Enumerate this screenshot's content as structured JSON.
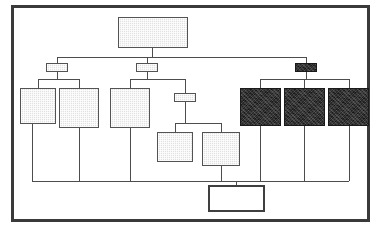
{
  "diagram": {
    "title": "",
    "frame": {
      "x": 11,
      "y": 5,
      "width": 359,
      "height": 217,
      "border_color": "#3a3a3a"
    },
    "palette": {
      "light_fill": "#e2e2e2",
      "dark_fill": "#262626",
      "empty_fill": "#ffffff",
      "line_color": "#4d4d4d",
      "border_color": "#4a4a4a",
      "background": "#ffffff"
    },
    "nodes": [
      {
        "id": "root",
        "label": "",
        "fill": "light",
        "x": 118,
        "y": 17,
        "width": 70,
        "height": 31,
        "level": 0
      },
      {
        "id": "conn-left",
        "label": "",
        "fill": "light",
        "x": 46,
        "y": 63,
        "width": 22,
        "height": 9,
        "level": 1
      },
      {
        "id": "conn-mid",
        "label": "",
        "fill": "light",
        "x": 136,
        "y": 63,
        "width": 22,
        "height": 9,
        "level": 1
      },
      {
        "id": "conn-right",
        "label": "",
        "fill": "dark",
        "x": 295,
        "y": 63,
        "width": 22,
        "height": 9,
        "level": 1
      },
      {
        "id": "box-l1",
        "label": "",
        "fill": "light",
        "x": 20,
        "y": 88,
        "width": 36,
        "height": 36,
        "level": 2
      },
      {
        "id": "box-l2",
        "label": "",
        "fill": "light",
        "x": 59,
        "y": 88,
        "width": 40,
        "height": 40,
        "level": 2
      },
      {
        "id": "box-m1",
        "label": "",
        "fill": "light",
        "x": 110,
        "y": 88,
        "width": 40,
        "height": 40,
        "level": 2
      },
      {
        "id": "conn-sub",
        "label": "",
        "fill": "light",
        "x": 174,
        "y": 93,
        "width": 22,
        "height": 9,
        "level": 2
      },
      {
        "id": "box-m2",
        "label": "",
        "fill": "light",
        "x": 157,
        "y": 132,
        "width": 36,
        "height": 30,
        "level": 3
      },
      {
        "id": "box-m3",
        "label": "",
        "fill": "light",
        "x": 202,
        "y": 132,
        "width": 38,
        "height": 34,
        "level": 3
      },
      {
        "id": "box-r1",
        "label": "",
        "fill": "dark",
        "x": 240,
        "y": 88,
        "width": 41,
        "height": 38,
        "level": 2
      },
      {
        "id": "box-r2",
        "label": "",
        "fill": "dark",
        "x": 284,
        "y": 88,
        "width": 41,
        "height": 38,
        "level": 2
      },
      {
        "id": "box-r3",
        "label": "",
        "fill": "dark",
        "x": 328,
        "y": 88,
        "width": 41,
        "height": 38,
        "level": 2
      },
      {
        "id": "box-bottom",
        "label": "",
        "fill": "none",
        "x": 208,
        "y": 185,
        "width": 57,
        "height": 27,
        "level": 4
      }
    ],
    "edges": [
      {
        "from": "root",
        "to": "bus-top",
        "type": "drop"
      },
      {
        "from": "bus-top",
        "to": "conn-left",
        "type": "drop"
      },
      {
        "from": "bus-top",
        "to": "conn-mid",
        "type": "drop"
      },
      {
        "from": "bus-top",
        "to": "conn-right",
        "type": "drop"
      },
      {
        "from": "conn-left",
        "to": "box-l1",
        "type": "fanout"
      },
      {
        "from": "conn-left",
        "to": "box-l2",
        "type": "fanout"
      },
      {
        "from": "conn-mid",
        "to": "box-m1",
        "type": "fanout"
      },
      {
        "from": "conn-mid",
        "to": "conn-sub",
        "type": "fanout"
      },
      {
        "from": "conn-sub",
        "to": "box-m2",
        "type": "fanout"
      },
      {
        "from": "conn-sub",
        "to": "box-m3",
        "type": "fanout"
      },
      {
        "from": "conn-right",
        "to": "box-r1",
        "type": "fanout"
      },
      {
        "from": "conn-right",
        "to": "box-r2",
        "type": "fanout"
      },
      {
        "from": "conn-right",
        "to": "box-r3",
        "type": "fanout"
      },
      {
        "from": "box-l1",
        "to": "bus-bottom",
        "type": "drop"
      },
      {
        "from": "box-l2",
        "to": "bus-bottom",
        "type": "drop"
      },
      {
        "from": "box-m1",
        "to": "bus-bottom",
        "type": "drop"
      },
      {
        "from": "box-m3",
        "to": "bus-bottom",
        "type": "drop"
      },
      {
        "from": "box-r1",
        "to": "bus-bottom",
        "type": "drop"
      },
      {
        "from": "box-r2",
        "to": "bus-bottom",
        "type": "drop"
      },
      {
        "from": "box-r3",
        "to": "bus-bottom",
        "type": "drop"
      },
      {
        "from": "bus-bottom",
        "to": "box-bottom",
        "type": "drop"
      }
    ],
    "buses": [
      {
        "id": "bus-top",
        "y": 57,
        "x1": 57,
        "x2": 306
      },
      {
        "id": "bus-bottom",
        "y": 181,
        "x1": 32,
        "x2": 349
      }
    ]
  }
}
